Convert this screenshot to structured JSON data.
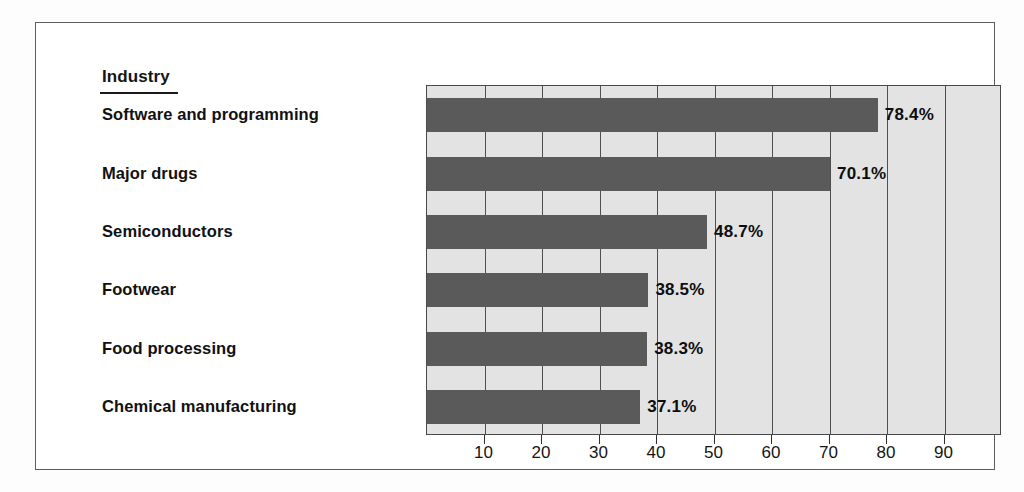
{
  "figure": {
    "category_axis_title": "Industry",
    "value_suffix": "%"
  },
  "chart_data": {
    "type": "bar",
    "orientation": "horizontal",
    "title": "",
    "subtitle": "",
    "xlabel": "",
    "ylabel": "Industry",
    "categories": [
      "Software and programming",
      "Major drugs",
      "Semiconductors",
      "Footwear",
      "Food processing",
      "Chemical manufacturing"
    ],
    "values": [
      78.4,
      70.1,
      48.7,
      38.5,
      38.3,
      37.1
    ],
    "value_labels": [
      "78.4%",
      "70.1%",
      "48.7%",
      "38.5%",
      "38.3%",
      "37.1%"
    ],
    "xlim": [
      0,
      100
    ],
    "xticks": [
      10,
      20,
      30,
      40,
      50,
      60,
      70,
      80,
      90
    ],
    "xtick_labels": [
      "10",
      "20",
      "30",
      "40",
      "50",
      "60",
      "70",
      "80",
      "90"
    ],
    "grid": true,
    "grid_axis": "x",
    "legend": false,
    "legend_position": "none",
    "bar_color": "#5a5a5a",
    "plot_background": "#e3e3e3",
    "frame_color": "#4a4a4a"
  }
}
